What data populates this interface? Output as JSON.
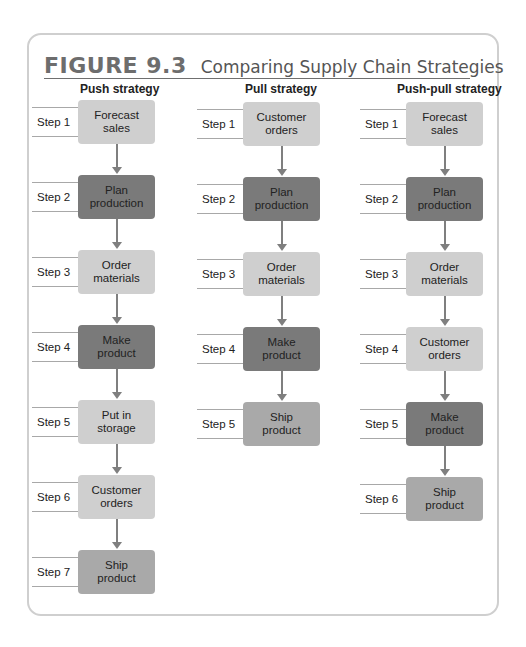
{
  "figure": {
    "number": "FIGURE 9.3",
    "title": "Comparing Supply Chain Strategies"
  },
  "colors": {
    "light_box": "#cfcfcf",
    "medium_box": "#a9a9a9",
    "dark_box": "#7a7a7a",
    "arrow": "#7f7f7f",
    "frame_border": "#cfcfcf"
  },
  "columns": [
    {
      "heading": "Push strategy",
      "steps": [
        {
          "label": "Step 1",
          "text": "Forecast\nsales",
          "shade": "light"
        },
        {
          "label": "Step 2",
          "text": "Plan\nproduction",
          "shade": "dark"
        },
        {
          "label": "Step 3",
          "text": "Order\nmaterials",
          "shade": "light"
        },
        {
          "label": "Step 4",
          "text": "Make\nproduct",
          "shade": "dark"
        },
        {
          "label": "Step 5",
          "text": "Put in\nstorage",
          "shade": "light"
        },
        {
          "label": "Step 6",
          "text": "Customer\norders",
          "shade": "light"
        },
        {
          "label": "Step 7",
          "text": "Ship\nproduct",
          "shade": "mid"
        }
      ]
    },
    {
      "heading": "Pull strategy",
      "steps": [
        {
          "label": "Step 1",
          "text": "Customer\norders",
          "shade": "light"
        },
        {
          "label": "Step 2",
          "text": "Plan\nproduction",
          "shade": "dark"
        },
        {
          "label": "Step 3",
          "text": "Order\nmaterials",
          "shade": "light"
        },
        {
          "label": "Step 4",
          "text": "Make\nproduct",
          "shade": "dark"
        },
        {
          "label": "Step 5",
          "text": "Ship\nproduct",
          "shade": "mid"
        }
      ]
    },
    {
      "heading": "Push-pull strategy",
      "steps": [
        {
          "label": "Step 1",
          "text": "Forecast\nsales",
          "shade": "light"
        },
        {
          "label": "Step 2",
          "text": "Plan\nproduction",
          "shade": "dark"
        },
        {
          "label": "Step 3",
          "text": "Order\nmaterials",
          "shade": "light"
        },
        {
          "label": "Step 4",
          "text": "Customer\norders",
          "shade": "light"
        },
        {
          "label": "Step 5",
          "text": "Make\nproduct",
          "shade": "dark"
        },
        {
          "label": "Step 6",
          "text": "Ship\nproduct",
          "shade": "mid"
        }
      ]
    }
  ]
}
